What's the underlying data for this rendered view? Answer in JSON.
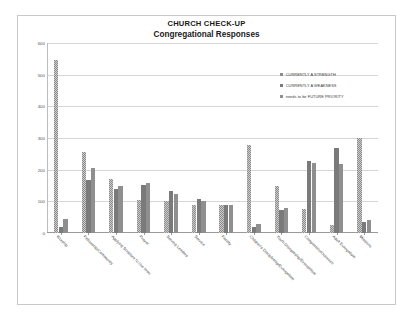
{
  "chart_data": {
    "type": "bar",
    "title": "CHURCH CHECK-UP",
    "subtitle": "Congregational Responses",
    "xlabel": "",
    "ylabel": "",
    "ylim": [
      0,
      600
    ],
    "yticks": [
      0,
      100,
      200,
      300,
      400,
      500,
      600
    ],
    "grid": true,
    "legend_position": "right",
    "categories": [
      "Worship",
      "Fellowship/Community",
      "Applying Scripture to Our lives",
      "Prayer",
      "Serving Leaders",
      "Service",
      "Facility",
      "Children's Discipleship/Evangelism",
      "Youth Discipleship/Evangelism",
      "Compassion/Outreach",
      "Adult Evangelism",
      "Missions"
    ],
    "series": [
      {
        "name": "CURRENTLY A STRENGTH",
        "color": "#8c8c8c",
        "values": [
          545,
          255,
          172,
          103,
          100,
          88,
          90,
          278,
          150,
          75,
          25,
          300
        ]
      },
      {
        "name": "CURRENTLY A WEAKNESS",
        "color": "#7a7a7a",
        "values": [
          18,
          168,
          140,
          152,
          133,
          108,
          88,
          20,
          72,
          228,
          268,
          35
        ]
      },
      {
        "name": "needs to be FUTURE PRIORITY",
        "color": "#8f8f8f",
        "values": [
          45,
          205,
          148,
          157,
          122,
          100,
          88,
          30,
          78,
          220,
          218,
          42
        ]
      }
    ]
  },
  "legend": {
    "items": [
      {
        "label": "CURRENTLY A STRENGTH"
      },
      {
        "label": "CURRENTLY A WEAKNESS"
      },
      {
        "label": "needs to be FUTURE PRIORITY"
      }
    ]
  }
}
